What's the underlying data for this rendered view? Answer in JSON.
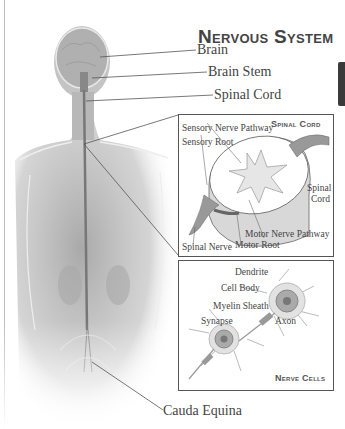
{
  "title": "Nervous System",
  "figure_labels": {
    "brain": "Brain",
    "brain_stem": "Brain Stem",
    "spinal_cord": "Spinal Cord",
    "cauda_equina": "Cauda Equina"
  },
  "spinal_cord_box": {
    "title": "Spinal Cord",
    "labels": {
      "sensory_nerve_pathway": "Sensory Nerve Pathway",
      "sensory_root": "Sensory Root",
      "spinal_cord_line1": "Spinal",
      "spinal_cord_line2": "Cord",
      "motor_nerve_pathway": "Motor Nerve Pathway",
      "motor_root": "Motor Root",
      "spinal_nerve": "Spinal Nerve"
    }
  },
  "nerve_cells_box": {
    "title": "Nerve Cells",
    "labels": {
      "dendrite": "Dendrite",
      "cell_body": "Cell Body",
      "myelin_sheath": "Myelin Sheath",
      "synapse": "Synapse",
      "axon": "Axon"
    }
  }
}
